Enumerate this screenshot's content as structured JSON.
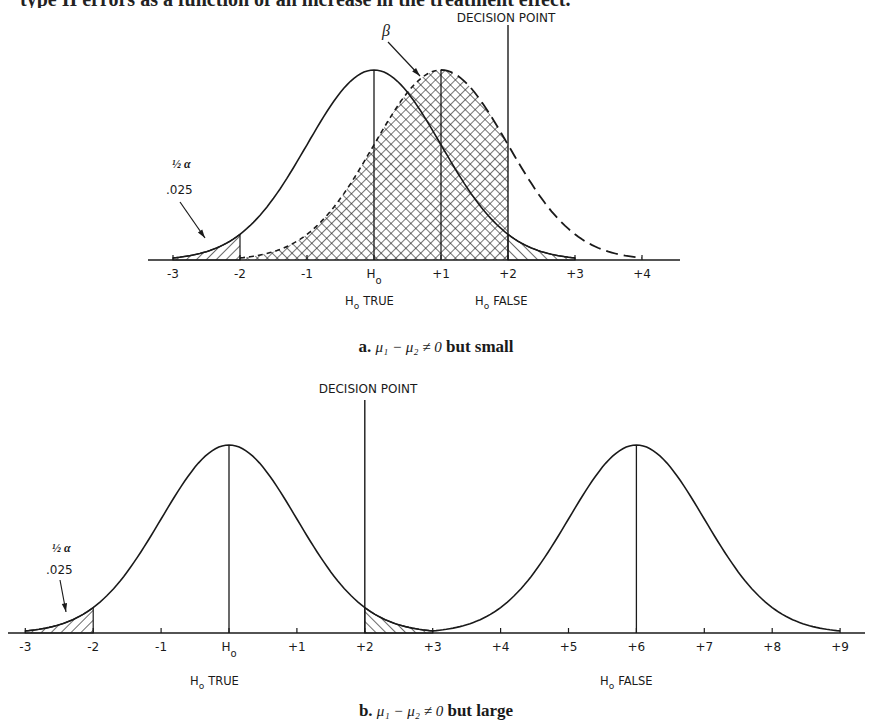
{
  "header": {
    "cutoff_text": "type II errors as a function of an increase in the treatment effect."
  },
  "colors": {
    "ink": "#1a1a1a",
    "background": "#ffffff"
  },
  "chart_data": [
    {
      "type": "line",
      "id": "panel-a",
      "title": "a.  μ₁ − μ₂ ≠ 0  but  small",
      "caption_prefix": "a.",
      "caption_math": "μ₁ − μ₂ ≠ 0",
      "caption_suffix": "but  small",
      "x_ticks": [
        "-3",
        "-2",
        "-1",
        "H",
        "+1",
        "+2",
        "+3",
        "+4"
      ],
      "x_tick_values": [
        -3,
        -2,
        -1,
        0,
        1,
        2,
        3,
        4
      ],
      "xlim": [
        -3,
        4
      ],
      "series": [
        {
          "name": "H0 distribution",
          "mean": 0,
          "sd": 1,
          "style": "solid"
        },
        {
          "name": "H1 distribution",
          "mean": 1,
          "sd": 1,
          "style": "dashed-right"
        }
      ],
      "decision_point": 2,
      "decision_label": "DECISION POINT",
      "beta_label": "β",
      "alpha_label": "½ α",
      "alpha_value": ".025",
      "region_labels": [
        "H TRUE",
        "H FALSE"
      ],
      "subscript": "o"
    },
    {
      "type": "line",
      "id": "panel-b",
      "title": "b.  μ₁ − μ₂ ≠ 0  but  large",
      "caption_prefix": "b.",
      "caption_math": "μ₁ − μ₂ ≠ 0",
      "caption_suffix": "but  large",
      "x_ticks": [
        "-3",
        "-2",
        "-1",
        "H",
        "+1",
        "+2",
        "+3",
        "+4",
        "+5",
        "+6",
        "+7",
        "+8",
        "+9"
      ],
      "x_tick_values": [
        -3,
        -2,
        -1,
        0,
        1,
        2,
        3,
        4,
        5,
        6,
        7,
        8,
        9
      ],
      "xlim": [
        -3,
        9
      ],
      "series": [
        {
          "name": "H0 distribution",
          "mean": 0,
          "sd": 1,
          "style": "solid"
        },
        {
          "name": "H1 distribution",
          "mean": 6,
          "sd": 1,
          "style": "solid"
        }
      ],
      "decision_point": 2,
      "decision_label": "DECISION POINT",
      "alpha_label": "½ α",
      "alpha_value": ".025",
      "region_labels": [
        "H TRUE",
        "H FALSE"
      ],
      "subscript": "o"
    }
  ]
}
